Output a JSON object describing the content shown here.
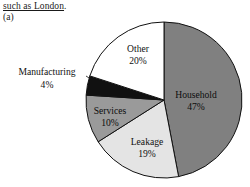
{
  "document": {
    "running_text": "such as London",
    "running_text_tail": ".",
    "figure_label": "(a)"
  },
  "chart_data": {
    "type": "pie",
    "title": "",
    "categories": [
      "Household",
      "Leakage",
      "Services",
      "Manufacturing",
      "Other"
    ],
    "values": [
      47,
      19,
      10,
      4,
      20
    ],
    "value_suffix": "%",
    "start_angle_deg": 0,
    "direction": "clockwise",
    "legend": "none",
    "labels_inside": true,
    "slices": [
      {
        "name": "Household",
        "label": "Household",
        "value": 47,
        "value_label": "47%",
        "color": "#808080",
        "label_placement": "inside",
        "label_x": 196,
        "label_y": 96,
        "value_x": 196,
        "value_y": 108
      },
      {
        "name": "Leakage",
        "label": "Leakage",
        "value": 19,
        "value_label": "19%",
        "color": "#e4e4e4",
        "label_placement": "inside",
        "label_x": 147,
        "label_y": 143,
        "value_x": 147,
        "value_y": 155
      },
      {
        "name": "Services",
        "label": "Services",
        "value": 10,
        "value_label": "10%",
        "color": "#9a9a9a",
        "label_placement": "inside",
        "label_x": 110,
        "label_y": 112,
        "value_x": 110,
        "value_y": 124
      },
      {
        "name": "Manufacturing",
        "label": "Manufacturing",
        "value": 4,
        "value_label": "4%",
        "color": "#111111",
        "label_placement": "outside",
        "label_x": 47,
        "label_y": 73,
        "value_x": 47,
        "value_y": 86,
        "leader_from_x": 86,
        "leader_from_y": 76,
        "leader_to_x": 97,
        "leader_to_y": 83
      },
      {
        "name": "Other",
        "label": "Other",
        "value": 20,
        "value_label": "20%",
        "color": "#ffffff",
        "label_placement": "inside",
        "label_x": 138,
        "label_y": 50,
        "value_x": 138,
        "value_y": 62
      }
    ],
    "geometry": {
      "center_x": 164,
      "center_y": 100,
      "radius": 78,
      "outline_color": "#111111",
      "outline_width": 1
    }
  }
}
